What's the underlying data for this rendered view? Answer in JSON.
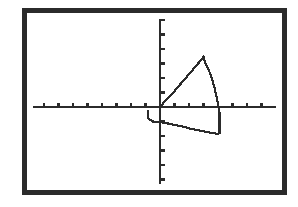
{
  "device": {
    "kind": "graphing-calculator-screen",
    "bezel_color": "#2b2b2b",
    "screen_background": "#ffffff",
    "ink_color": "#2b2b2b"
  },
  "chart_data": {
    "type": "line",
    "title": "",
    "subtitle": "",
    "xlabel": "",
    "ylabel": "",
    "legend": [],
    "legend_position": "none",
    "grid": false,
    "axes": {
      "x_axis_visible": true,
      "y_axis_visible": true,
      "origin_px": [
        133,
        94
      ],
      "tick_marks": true,
      "tick_spacing_px": 14.5,
      "x_tick_count_left": 9,
      "x_tick_count_right": 9,
      "y_tick_count_above": 6,
      "y_tick_count_below": 6,
      "xlim": [
        -9,
        9
      ],
      "ylim": [
        -6,
        6
      ]
    },
    "annotations": [],
    "series": [
      {
        "name": "upper-branch",
        "description": "rises from origin to sharp peak then drops steeply through the x-axis",
        "x": [
          0.0,
          0.3,
          0.7,
          1.0,
          1.3,
          1.6,
          1.9,
          2.2,
          2.5,
          2.8,
          3.0,
          3.1,
          3.2,
          3.3,
          3.4,
          3.5,
          3.6,
          3.7,
          3.8,
          3.9,
          4.0,
          4.1
        ],
        "y": [
          0.0,
          0.35,
          0.75,
          1.1,
          1.45,
          1.8,
          2.15,
          2.5,
          2.85,
          3.2,
          3.45,
          3.1,
          2.9,
          2.7,
          2.45,
          2.2,
          1.9,
          1.55,
          1.15,
          0.7,
          0.2,
          -0.35
        ]
      },
      {
        "name": "lower-branch",
        "description": "starts just left of the y-axis, steps down and runs nearly flat to the right, ending below the descending branch",
        "x": [
          -0.85,
          -0.85,
          -0.5,
          0.1,
          0.6,
          1.1,
          1.6,
          2.1,
          2.6,
          3.1,
          3.6,
          4.0,
          4.1
        ],
        "y": [
          -0.2,
          -0.75,
          -1.0,
          -1.05,
          -1.15,
          -1.25,
          -1.35,
          -1.5,
          -1.6,
          -1.7,
          -1.8,
          -1.85,
          -1.85
        ]
      },
      {
        "name": "closing-segment",
        "description": "vertical drop connecting the end of the upper branch down to the end of the lower branch",
        "x": [
          4.1,
          4.1
        ],
        "y": [
          -0.35,
          -1.85
        ]
      }
    ]
  }
}
